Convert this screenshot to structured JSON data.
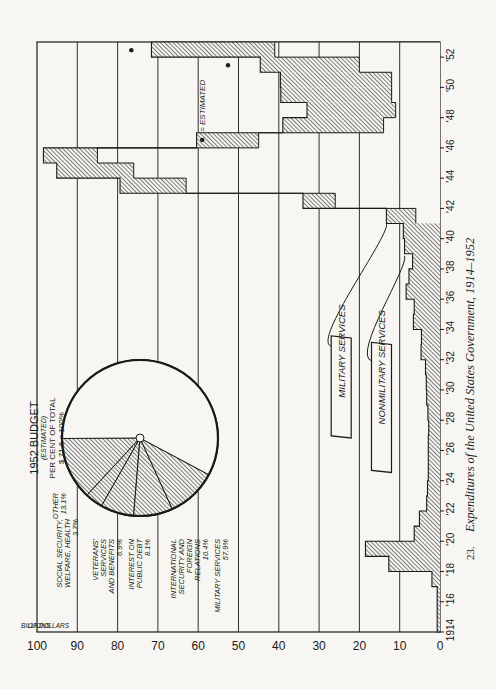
{
  "chart_data": {
    "type": "bar",
    "orientation_note": "figure printed rotated 90 degrees counterclockwise",
    "title": "Expenditures of the United States Government, 1914–1952",
    "figure_number": "23.",
    "xlabel": "",
    "ylabel": "BILLIONS OF DOLLARS",
    "ylim": [
      0,
      100
    ],
    "yticks": [
      0,
      10,
      20,
      30,
      40,
      50,
      60,
      70,
      80,
      90,
      100
    ],
    "xtick_labels": [
      "1914",
      "'16",
      "'18",
      "'20",
      "'22",
      "'24",
      "'26",
      "'28",
      "'30",
      "'32",
      "'34",
      "'36",
      "'38",
      "'40",
      "'42",
      "'44",
      "'46",
      "'48",
      "'50",
      "'52"
    ],
    "grid": true,
    "categories": [
      1914,
      1915,
      1916,
      1917,
      1918,
      1919,
      1920,
      1921,
      1922,
      1923,
      1924,
      1925,
      1926,
      1927,
      1928,
      1929,
      1930,
      1931,
      1932,
      1933,
      1934,
      1935,
      1936,
      1937,
      1938,
      1939,
      1940,
      1941,
      1942,
      1943,
      1944,
      1945,
      1946,
      1947,
      1948,
      1949,
      1950,
      1951,
      1952
    ],
    "series": [
      {
        "name": "NONMILITARY SERVICES",
        "values": [
          0.4,
          0.4,
          0.4,
          0.6,
          5.5,
          5.0,
          4.4,
          3.6,
          2.4,
          2.4,
          2.2,
          2.3,
          2.3,
          2.2,
          2.3,
          2.6,
          2.7,
          2.9,
          4.0,
          3.9,
          5.9,
          5.6,
          7.5,
          6.8,
          5.8,
          7.6,
          7.6,
          7.3,
          8.0,
          16.4,
          19.1,
          13.4,
          15.4,
          25.0,
          22.0,
          27.5,
          27.6,
          24.6,
          30.6
        ]
      },
      {
        "name": "MILITARY SERVICES",
        "values": [
          0.3,
          0.3,
          0.3,
          1.4,
          7.2,
          13.5,
          2.0,
          1.5,
          0.9,
          0.7,
          0.7,
          0.6,
          0.6,
          0.6,
          0.7,
          0.7,
          0.7,
          0.7,
          0.7,
          0.7,
          0.7,
          0.8,
          0.9,
          0.9,
          1.0,
          1.2,
          1.5,
          6.0,
          26.0,
          63.0,
          76.0,
          85.0,
          45.0,
          14.0,
          11.0,
          12.0,
          12.0,
          20.0,
          41.0
        ]
      }
    ],
    "totals": [
      0.7,
      0.7,
      0.7,
      2.0,
      12.7,
      18.5,
      6.4,
      5.1,
      3.3,
      3.1,
      2.9,
      2.9,
      2.9,
      2.8,
      3.0,
      3.3,
      3.4,
      3.6,
      4.7,
      4.6,
      6.6,
      6.4,
      8.4,
      7.7,
      6.8,
      8.8,
      9.1,
      13.3,
      34.0,
      79.4,
      95.1,
      98.4,
      60.4,
      39.0,
      33.0,
      39.5,
      39.6,
      44.6,
      71.6
    ],
    "estimated_years": [
      1951,
      1952
    ],
    "annotations": [
      {
        "text": "MILITARY SERVICES",
        "type": "callout"
      },
      {
        "text": "NONMILITARY SERVICES",
        "type": "callout"
      },
      {
        "text": "● = ESTIMATED",
        "type": "legend"
      }
    ],
    "inset_pie": {
      "type": "pie",
      "title": "1952 BUDGET",
      "subtitle": "(ESTIMATED)",
      "note1": "PER CENT OF TOTAL",
      "note2": "$ 71.6 = 100%",
      "slices": [
        {
          "label": "OTHER",
          "value": 13.1,
          "display": "13.1%"
        },
        {
          "label": "SOCIAL SECURITY, WELFARE, HEALTH",
          "value": 3.7,
          "display": "3.7%"
        },
        {
          "label": "VETERANS' SERVICES AND BENEFITS",
          "value": 6.9,
          "display": "6.9%"
        },
        {
          "label": "INTEREST ON PUBLIC DEBT",
          "value": 8.1,
          "display": "8.1%"
        },
        {
          "label": "INTERNATIONAL SECURITY AND FOREIGN RELATIONS",
          "value": 10.4,
          "display": "10.4%"
        },
        {
          "label": "MILITARY SERVICES",
          "value": 57.9,
          "display": "57.9%"
        }
      ]
    }
  },
  "labels": {
    "axis_unit_line1": "BILLIONS",
    "axis_unit_line2": "OF DOLLARS",
    "callout_military": "MILITARY SERVICES",
    "callout_nonmilitary": "NONMILITARY SERVICES",
    "estimated_legend": "= ESTIMATED",
    "caption_number": "23.",
    "caption_text": "Expenditures of the United States Government, 1914–1952",
    "pie_title": "1952 BUDGET",
    "pie_subtitle": "(ESTIMATED)",
    "pie_note1": "PER CENT OF TOTAL",
    "pie_note2": "$ 71.6 = 100%",
    "pie_other": "OTHER",
    "pie_other_pct": "13.1%",
    "pie_social_1": "SOCIAL SECURITY,",
    "pie_social_2": "WELFARE, HEALTH",
    "pie_social_pct": "3.7%",
    "pie_vet_1": "VETERANS'",
    "pie_vet_2": "SERVICES",
    "pie_vet_3": "AND BENEFITS",
    "pie_vet_pct": "6.9%",
    "pie_int_1": "INTEREST ON",
    "pie_int_2": "PUBLIC DEBT",
    "pie_int_pct": "8.1%",
    "pie_isfr_1": "INTERNATIONAL",
    "pie_isfr_2": "SECURITY AND",
    "pie_isfr_3": "FOREIGN",
    "pie_isfr_4": "RELATIONS",
    "pie_isfr_pct": "10.4%",
    "pie_mil_1": "MILITARY SERVICES",
    "pie_mil_pct": "57.9%"
  },
  "colors": {
    "ink": "#1a1a1a",
    "paper": "#f7f6f2",
    "hatch": "#3a3a3a"
  }
}
